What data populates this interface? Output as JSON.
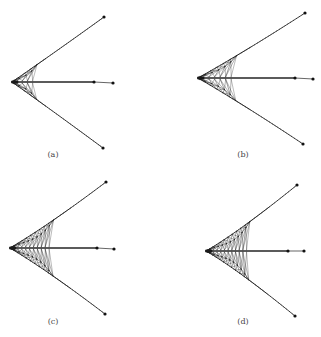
{
  "figure": {
    "background": "#ffffff",
    "stroke_color": "#1a1a1a",
    "node_color": "#111111",
    "panels": [
      {
        "id": "a",
        "label": "(a)",
        "label_pos": [
          53,
          157
        ],
        "apex": [
          12,
          82
        ],
        "top_tip": [
          104,
          17
        ],
        "bottom_tip": [
          103,
          148
        ],
        "mid_node": [
          94,
          82
        ],
        "right_node": [
          113,
          83
        ],
        "lattice_depth": 0.28,
        "lattice_bulge": 2,
        "rings": 4
      },
      {
        "id": "b",
        "label": "(b)",
        "label_pos": [
          243,
          157
        ],
        "apex": [
          198,
          78
        ],
        "top_tip": [
          305,
          13
        ],
        "bottom_tip": [
          303,
          144
        ],
        "mid_node": [
          295,
          78
        ],
        "right_node": [
          313,
          79
        ],
        "lattice_depth": 0.38,
        "lattice_bulge": 5,
        "rings": 6
      },
      {
        "id": "c",
        "label": "(c)",
        "label_pos": [
          53,
          324
        ],
        "apex": [
          10,
          248
        ],
        "top_tip": [
          106,
          182
        ],
        "bottom_tip": [
          105,
          314
        ],
        "mid_node": [
          97,
          248
        ],
        "right_node": [
          114,
          249
        ],
        "lattice_depth": 0.5,
        "lattice_bulge": 10,
        "rings": 10
      },
      {
        "id": "d",
        "label": "(d)",
        "label_pos": [
          243,
          324
        ],
        "apex": [
          206,
          251
        ],
        "top_tip": [
          297,
          185
        ],
        "bottom_tip": [
          295,
          316
        ],
        "mid_node": [
          288,
          251
        ],
        "right_node": [
          304,
          251
        ],
        "lattice_depth": 0.55,
        "lattice_bulge": 14,
        "rings": 11
      }
    ]
  }
}
